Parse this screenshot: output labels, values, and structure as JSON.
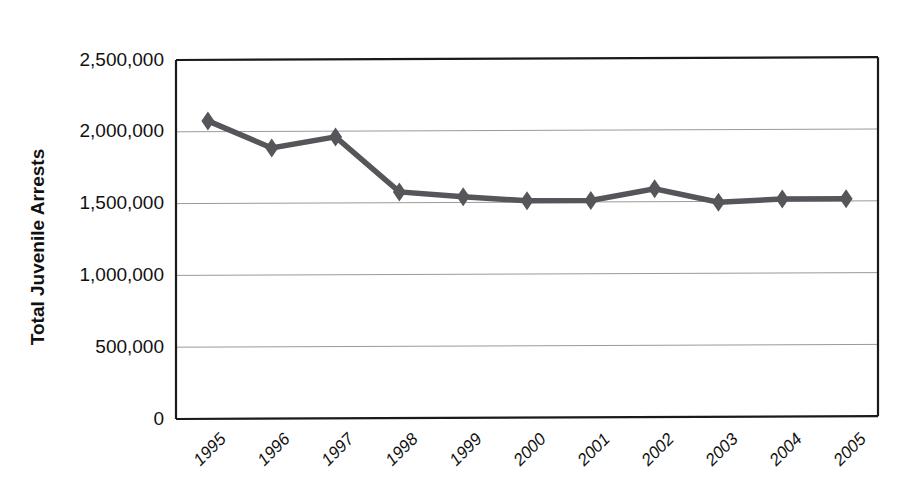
{
  "chart_data": {
    "type": "line",
    "title": "",
    "xlabel": "",
    "ylabel": "Total Juvenile Arrests",
    "categories": [
      "1995",
      "1996",
      "1997",
      "1998",
      "1999",
      "2000",
      "2001",
      "2002",
      "2003",
      "2004",
      "2005"
    ],
    "values": [
      2075000,
      1885000,
      1960000,
      1575000,
      1540000,
      1510000,
      1510000,
      1590000,
      1495000,
      1515000,
      1515000
    ],
    "series": [
      {
        "name": "Total Juvenile Arrests",
        "values": [
          2075000,
          1885000,
          1960000,
          1575000,
          1540000,
          1510000,
          1510000,
          1590000,
          1495000,
          1515000,
          1515000
        ]
      }
    ],
    "ylim": [
      0,
      2500000
    ],
    "ytick_values": [
      0,
      500000,
      1000000,
      1500000,
      2000000,
      2500000
    ],
    "ytick_labels": [
      "0",
      "500,000",
      "1,000,000",
      "1,500,000",
      "2,000,000",
      "2,500,000"
    ],
    "grid": true,
    "legend": "none",
    "marker": "diamond",
    "series_color": "#55555a",
    "grid_color": "#9a9a9a",
    "axis_color": "#1a1a1a",
    "background_color": "#ffffff",
    "xtick_rotation_deg": -45
  }
}
